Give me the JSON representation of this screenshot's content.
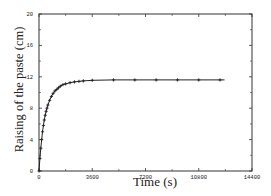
{
  "chart_data": {
    "type": "line",
    "title": "",
    "xlabel": "Time (s)",
    "ylabel": "Raising of the paste (cm)",
    "xlim": [
      0,
      14400
    ],
    "ylim": [
      0,
      20
    ],
    "xticks": [
      0,
      3600,
      7200,
      10800,
      14400
    ],
    "xtick_labels": [
      "0",
      "3600",
      "7200",
      "10800",
      "14400"
    ],
    "yticks": [
      0,
      4,
      8,
      12,
      16,
      20
    ],
    "ytick_labels": [
      "0",
      "4",
      "8",
      "12",
      "16",
      "20"
    ],
    "grid": false,
    "legend": null,
    "series": [
      {
        "name": "Raising of the paste",
        "marker": "plus",
        "x": [
          0,
          60,
          120,
          180,
          240,
          300,
          360,
          420,
          480,
          540,
          600,
          720,
          840,
          960,
          1080,
          1200,
          1320,
          1440,
          1620,
          1800,
          2100,
          2400,
          2700,
          3000,
          3600,
          5040,
          6480,
          7920,
          9360,
          10800,
          12240
        ],
        "y": [
          0,
          1.6,
          2.9,
          4.0,
          5.0,
          5.8,
          6.5,
          7.1,
          7.6,
          8.0,
          8.4,
          9.0,
          9.5,
          9.9,
          10.2,
          10.4,
          10.6,
          10.8,
          11.0,
          11.1,
          11.25,
          11.35,
          11.42,
          11.48,
          11.55,
          11.6,
          11.6,
          11.6,
          11.6,
          11.6,
          11.6
        ]
      }
    ]
  }
}
